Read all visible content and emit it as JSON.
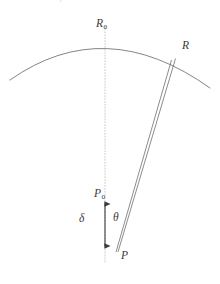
{
  "figure": {
    "caption_fragment": "Rationale for parallax correction and distance measurement",
    "background_color": "#ffffff",
    "stroke_color": "#6e6e6e",
    "label_color": "#3a3a3a",
    "guide_color": "#bdbdbd",
    "arrow_color": "#3c3c3c",
    "labels": {
      "arc_apex": {
        "base": "R",
        "sub": "0",
        "name": "R-zero"
      },
      "arc_point": {
        "base": "R",
        "sub": "",
        "name": "R"
      },
      "observer_top": {
        "base": "P",
        "sub": "0",
        "name": "P-zero"
      },
      "offset": {
        "base": "δ",
        "sub": "",
        "name": "delta"
      },
      "angle": {
        "base": "θ",
        "sub": "",
        "name": "theta"
      },
      "observer_bottom": {
        "base": "P",
        "sub": "",
        "name": "P"
      }
    },
    "geometry": {
      "arc": {
        "left_end": [
          10,
          80
        ],
        "apex": [
          105,
          33
        ],
        "right_end": [
          210,
          88
        ],
        "control": [
          105,
          14
        ]
      },
      "axis_line": {
        "x": 105,
        "y_top": 26,
        "y_bottom": 262,
        "style": "dotted"
      },
      "point_R": [
        175,
        58
      ],
      "point_P": [
        118,
        252
      ],
      "sight_line_outer": [
        [
          175,
          58
        ],
        [
          118,
          252
        ]
      ],
      "sight_line_inner": [
        [
          171,
          59
        ],
        [
          116,
          252
        ]
      ],
      "arrow": {
        "x": 105,
        "y_top": 200,
        "y_bottom": 250,
        "heads": "both"
      }
    }
  }
}
